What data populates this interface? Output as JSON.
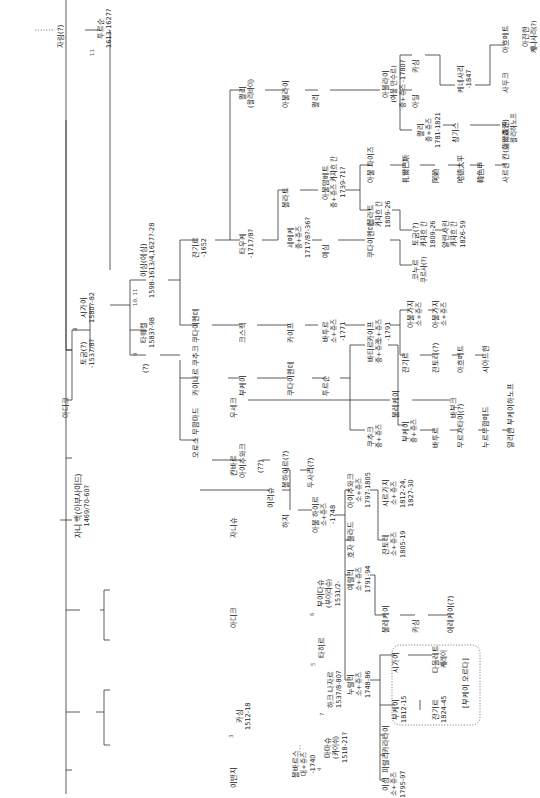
{
  "diagram": {
    "type": "genealogy-tree",
    "orientation": "rotated-90-ccw",
    "root": {
      "name": "자니 백(아부사이드)",
      "dates": "1469/70-60?"
    },
    "nodes": [
      {
        "id": "root",
        "name": "자니 백(아부사이드)",
        "dates": "1469/70-60?",
        "x": 83,
        "y": 520,
        "num": ""
      },
      {
        "id": "ibanji",
        "name": "이반지",
        "dates": "",
        "x": 238,
        "y": 770,
        "num": ""
      },
      {
        "id": "kasim",
        "name": "카심",
        "dates": "1512-18",
        "x": 244,
        "y": 712,
        "num": "3"
      },
      {
        "id": "mamasu",
        "name": "마마슈",
        "dates": "(카이쉬)\n1518-21?",
        "x": 332,
        "y": 745,
        "num": "4"
      },
      {
        "id": "hake",
        "name": "하크 나자르",
        "dates": "1537/8-80?",
        "x": 335,
        "y": 690,
        "num": "7"
      },
      {
        "id": "adik1",
        "name": "아디크",
        "dates": "",
        "x": 238,
        "y": 610,
        "num": ""
      },
      {
        "id": "tahir",
        "name": "타히르",
        "dates": "",
        "x": 326,
        "y": 640,
        "num": "5"
      },
      {
        "id": "buidash",
        "name": "부이다슈",
        "dates": "(부이라슈)\n1531/2-",
        "x": 325,
        "y": 590,
        "num": "6"
      },
      {
        "id": "janish",
        "name": "자니슈",
        "dates": "",
        "x": 238,
        "y": 520,
        "num": ""
      },
      {
        "id": "kanbar",
        "name": "칸바르",
        "dates": "",
        "x": 238,
        "y": 458,
        "num": ""
      },
      {
        "id": "useke",
        "name": "우세크",
        "dates": "",
        "x": 238,
        "y": 400,
        "num": ""
      },
      {
        "id": "buljekei",
        "name": "불레케이",
        "dates": "",
        "x": 400,
        "y": 400,
        "num": ""
      },
      {
        "id": "bauk",
        "name": "바부크",
        "dates": "",
        "x": 458,
        "y": 400,
        "num": ""
      },
      {
        "id": "adik2",
        "name": "아디크",
        "dates": "",
        "x": 70,
        "y": 400,
        "num": ""
      },
      {
        "id": "togum",
        "name": "토굼(?)",
        "dates": "-1537/8?",
        "x": 88,
        "y": 350,
        "num": ""
      },
      {
        "id": "shigai",
        "name": "시가이",
        "dates": "1580?-82",
        "x": 88,
        "y": 305,
        "num": "8"
      },
      {
        "id": "tauekel",
        "name": "타웨켈",
        "dates": "1583?-98",
        "x": 148,
        "y": 330,
        "num": "9"
      },
      {
        "id": "q",
        "name": "(?)",
        "dates": "",
        "x": 150,
        "y": 355,
        "num": ""
      },
      {
        "id": "ishim",
        "name": "이심(에심)",
        "dates": "1598-1613/4,1627?-28",
        "x": 148,
        "y": 280,
        "num": "10, 11"
      },
      {
        "id": "tursun",
        "name": "투르순",
        "dates": "1613-1627?",
        "x": 105,
        "y": 30,
        "num": "11"
      },
      {
        "id": "jalim",
        "name": "자림(?)",
        "dates": "",
        "x": 65,
        "y": 30,
        "num": ""
      },
      {
        "id": "jangir",
        "name": "잔기르",
        "dates": "-1652",
        "x": 200,
        "y": 240,
        "num": ""
      },
      {
        "id": "kudaimende1",
        "name": "쿠다이멘데",
        "dates": "",
        "x": 200,
        "y": 325,
        "num": ""
      },
      {
        "id": "kaianar",
        "name": "카이나르 쿠추크",
        "dates": "",
        "x": 200,
        "y": 378,
        "num": ""
      },
      {
        "id": "oraz",
        "name": "오로스 무함마드",
        "dates": "",
        "x": 200,
        "y": 440,
        "num": ""
      },
      {
        "id": "tauke",
        "name": "타우케",
        "dates": "-1717/8?",
        "x": 247,
        "y": 240,
        "num": ""
      },
      {
        "id": "kesek",
        "name": "크스렉",
        "dates": "",
        "x": 247,
        "y": 325,
        "num": ""
      },
      {
        "id": "bukei",
        "name": "부케이",
        "dates": "",
        "x": 247,
        "y": 378,
        "num": ""
      },
      {
        "id": "aichuvak",
        "name": "아이추와크",
        "dates": "",
        "x": 247,
        "y": 460,
        "num": ""
      },
      {
        "id": "ualie",
        "name": "왈리",
        "dates": "(왈리바이)",
        "x": 247,
        "y": 90,
        "num": ""
      },
      {
        "id": "abulkair2",
        "name": "아불라이",
        "dates": "",
        "x": 290,
        "y": 90,
        "num": ""
      },
      {
        "id": "vali2",
        "name": "왈리",
        "dates": "",
        "x": 320,
        "y": 90,
        "num": ""
      },
      {
        "id": "ablai",
        "name": "아블라이",
        "dates": "(아불 만수르)\n중+쥬즈 -1780?",
        "x": 390,
        "y": 90,
        "num": ""
      },
      {
        "id": "kasim2",
        "name": "카심",
        "dates": "",
        "x": 420,
        "y": 55,
        "num": ""
      },
      {
        "id": "adil",
        "name": "아딜",
        "dates": "",
        "x": 420,
        "y": 90,
        "num": ""
      },
      {
        "id": "vali3",
        "name": "왈리",
        "dates": "중+쥬즈\n1781-1821",
        "x": 425,
        "y": 130,
        "num": ""
      },
      {
        "id": "kenesary",
        "name": "케네사리",
        "dates": "-1847",
        "x": 465,
        "y": 75,
        "num": ""
      },
      {
        "id": "sadik",
        "name": "사두크",
        "dates": "",
        "x": 510,
        "y": 75,
        "num": ""
      },
      {
        "id": "ahmet",
        "name": "아흐메트",
        "dates": "",
        "x": 510,
        "y": 35,
        "num": ""
      },
      {
        "id": "ajanhan",
        "name": "아잔한",
        "dates": "케나사리(?)",
        "x": 530,
        "y": 35,
        "num": ""
      },
      {
        "id": "chinggis",
        "name": "칭기스",
        "dates": "",
        "x": 460,
        "y": 125,
        "num": ""
      },
      {
        "id": "chokan",
        "name": "초칸",
        "dates": "왈리하노프",
        "x": 510,
        "y": 125,
        "num": ""
      },
      {
        "id": "bolat",
        "name": "볼라트",
        "dates": "",
        "x": 290,
        "y": 190,
        "num": ""
      },
      {
        "id": "abulmambet",
        "name": "아불맘베트",
        "dates": "중+쥬즈 카자흐 칸\n1739-71?",
        "x": 330,
        "y": 190,
        "num": ""
      },
      {
        "id": "abulpeiz",
        "name": "아불 파이즈",
        "dates": "",
        "x": 375,
        "y": 165,
        "num": ""
      },
      {
        "id": "bolat2",
        "name": "볼라트",
        "dates": "카자흐 칸\n1809-26",
        "x": 375,
        "y": 210,
        "num": ""
      },
      {
        "id": "chanbaz",
        "name": "扎爾巴斯",
        "dates": "",
        "x": 410,
        "y": 165,
        "num": ""
      },
      {
        "id": "arlat",
        "name": "阿赖",
        "dates": "",
        "x": 440,
        "y": 165,
        "num": ""
      },
      {
        "id": "adul",
        "name": "哈德太平",
        "dates": "",
        "x": 465,
        "y": 165,
        "num": ""
      },
      {
        "id": "han",
        "name": "韓色甲",
        "dates": "",
        "x": 485,
        "y": 165,
        "num": ""
      },
      {
        "id": "sarsen",
        "name": "사르센 칸(薩爾森汗)",
        "dates": "",
        "x": 510,
        "y": 165,
        "num": ""
      },
      {
        "id": "togum2",
        "name": "토굼(?)",
        "dates": "카자흐 칸\n1809-26",
        "x": 420,
        "y": 230,
        "num": ""
      },
      {
        "id": "aralgyn",
        "name": "얄란사린",
        "dates": "카자흐 칸\n1826-59",
        "x": 450,
        "y": 230,
        "num": ""
      },
      {
        "id": "semeke",
        "name": "세메케",
        "dates": "중+쥬즈\n1717/8?-36?",
        "x": 295,
        "y": 240,
        "num": ""
      },
      {
        "id": "esim",
        "name": "예심",
        "dates": "",
        "x": 330,
        "y": 240,
        "num": ""
      },
      {
        "id": "kudaimende2",
        "name": "쿠다이멘데",
        "dates": "",
        "x": 375,
        "y": 240,
        "num": ""
      },
      {
        "id": "konurkul",
        "name": "코누르",
        "dates": "쿠르사(?)",
        "x": 420,
        "y": 265,
        "num": ""
      },
      {
        "id": "kaip",
        "name": "카이프",
        "dates": "",
        "x": 295,
        "y": 325,
        "num": ""
      },
      {
        "id": "batur",
        "name": "바투르",
        "dates": "소+쥬즈\n-1771",
        "x": 330,
        "y": 325,
        "num": ""
      },
      {
        "id": "kaip2",
        "name": "카이프",
        "dates": "소+쥬즈\n-1791",
        "x": 375,
        "y": 325,
        "num": ""
      },
      {
        "id": "abulgazy",
        "name": "아불가지",
        "dates": "소+쥬즈",
        "x": 415,
        "y": 310,
        "num": ""
      },
      {
        "id": "abulgazy2",
        "name": "아불가지",
        "dates": "소+쥬즈",
        "x": 440,
        "y": 310,
        "num": ""
      },
      {
        "id": "jangir2",
        "name": "잔기르",
        "dates": "",
        "x": 410,
        "y": 355,
        "num": ""
      },
      {
        "id": "jantore",
        "name": "잔토레(?)",
        "dates": "",
        "x": 440,
        "y": 355,
        "num": ""
      },
      {
        "id": "ahmet2",
        "name": "아흐메트",
        "dates": "",
        "x": 465,
        "y": 355,
        "num": ""
      },
      {
        "id": "shigai2",
        "name": "시아드한",
        "dates": "",
        "x": 490,
        "y": 355,
        "num": ""
      },
      {
        "id": "kudaimende3",
        "name": "쿠다이멘데",
        "dates": "",
        "x": 295,
        "y": 378,
        "num": ""
      },
      {
        "id": "tursun2",
        "name": "투르순",
        "dates": "",
        "x": 330,
        "y": 378,
        "num": ""
      },
      {
        "id": "batyr2",
        "name": "바티르",
        "dates": "중+쥬즈",
        "x": 375,
        "y": 345,
        "num": ""
      },
      {
        "id": "kuchuk",
        "name": "쿠추크",
        "dates": "중+쥬즈",
        "x": 375,
        "y": 430,
        "num": ""
      },
      {
        "id": "bukei2",
        "name": "부케이",
        "dates": "중+쥬즈",
        "x": 410,
        "y": 425,
        "num": ""
      },
      {
        "id": "batur2",
        "name": "바투르",
        "dates": "",
        "x": 440,
        "y": 430,
        "num": ""
      },
      {
        "id": "murzatai",
        "name": "무르자타이(?)",
        "dates": "",
        "x": 465,
        "y": 430,
        "num": ""
      },
      {
        "id": "nurmu",
        "name": "누르무함메드",
        "dates": "",
        "x": 490,
        "y": 430,
        "num": ""
      },
      {
        "id": "alikhan",
        "name": "알리한 부케이하노프",
        "dates": "",
        "x": 515,
        "y": 430,
        "num": ""
      },
      {
        "id": "q2",
        "name": "(??)",
        "dates": "",
        "x": 265,
        "y": 455,
        "num": ""
      },
      {
        "id": "irisu",
        "name": "이리슈",
        "dates": "",
        "x": 275,
        "y": 490,
        "num": ""
      },
      {
        "id": "bolgai",
        "name": "볼하이르(?)",
        "dates": "",
        "x": 290,
        "y": 470,
        "num": ""
      },
      {
        "id": "dusali",
        "name": "두사리(?)",
        "dates": "",
        "x": 315,
        "y": 470,
        "num": ""
      },
      {
        "id": "haji",
        "name": "하지",
        "dates": "",
        "x": 290,
        "y": 510,
        "num": ""
      },
      {
        "id": "abulkhair",
        "name": "아불 하이르",
        "dates": "소+쥬즈\n-1748",
        "x": 320,
        "y": 515,
        "num": ""
      },
      {
        "id": "aichuvak2",
        "name": "아이추와크",
        "dates": "소+쥬즈\n1797-1805",
        "x": 355,
        "y": 490,
        "num": ""
      },
      {
        "id": "shirgazy",
        "name": "시르가지",
        "dates": "소+쥬즈\n1812-24,\n1827-30",
        "x": 390,
        "y": 490,
        "num": ""
      },
      {
        "id": "jantore2",
        "name": "잔토레",
        "dates": "소+쥬즈\n1805-19",
        "x": 390,
        "y": 540,
        "num": ""
      },
      {
        "id": "khoja",
        "name": "호자 쿨라드",
        "dates": "",
        "x": 355,
        "y": 540,
        "num": ""
      },
      {
        "id": "eraly",
        "name": "예랄리",
        "dates": "소+쥬즈\n1791-94",
        "x": 355,
        "y": 575,
        "num": ""
      },
      {
        "id": "buljekei2",
        "name": "불레케이",
        "dates": "",
        "x": 390,
        "y": 615,
        "num": ""
      },
      {
        "id": "kasim3",
        "name": "카심",
        "dates": "",
        "x": 420,
        "y": 615,
        "num": ""
      },
      {
        "id": "erekei",
        "name": "에레케이(?)",
        "dates": "",
        "x": 455,
        "y": 615,
        "num": ""
      },
      {
        "id": "nurali",
        "name": "누랄리",
        "dates": "소+쥬즈\n1748-86",
        "x": 355,
        "y": 680,
        "num": ""
      },
      {
        "id": "shigai3",
        "name": "시가이",
        "dates": "",
        "x": 400,
        "y": 655,
        "num": ""
      },
      {
        "id": "daulet",
        "name": "다울레트",
        "dates": "케레이",
        "x": 440,
        "y": 655,
        "num": ""
      },
      {
        "id": "bukei3",
        "name": "부케이",
        "dates": "1812-15",
        "x": 400,
        "y": 705,
        "num": ""
      },
      {
        "id": "jangir3",
        "name": "잔기르",
        "dates": "1824-45",
        "x": 440,
        "y": 705,
        "num": ""
      },
      {
        "id": "bukeiorda",
        "name": "[부케이 오르다]",
        "dates": "",
        "x": 470,
        "y": 690,
        "num": ""
      },
      {
        "id": "karatai",
        "name": "카라타이",
        "dates": "",
        "x": 390,
        "y": 735,
        "num": ""
      },
      {
        "id": "pirali",
        "name": "피랄리",
        "dates": "",
        "x": 390,
        "y": 755,
        "num": ""
      },
      {
        "id": "ishim2",
        "name": "이심",
        "dates": "소+쥬즈\n1795-97",
        "x": 390,
        "y": 780,
        "num": ""
      },
      {
        "id": "bolbaris",
        "name": "볼바르스",
        "dates": "대+쥬즈\n-1740",
        "x": 300,
        "y": 760,
        "num": ""
      }
    ]
  }
}
